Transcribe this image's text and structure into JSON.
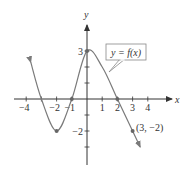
{
  "chart_data": {
    "type": "line",
    "title": "",
    "xlabel": "x",
    "ylabel": "y",
    "xlim": [
      -4.5,
      5
    ],
    "ylim": [
      -3,
      4
    ],
    "x_ticks": [
      -4,
      -3,
      -2,
      -1,
      1,
      2,
      3,
      4
    ],
    "x_tick_labels": [
      "−4",
      "−2",
      "−1",
      "1",
      "2",
      "3",
      "4"
    ],
    "x_tick_label_values": [
      -4,
      -2,
      -1,
      1,
      2,
      3,
      4
    ],
    "y_ticks": [
      -3,
      -2,
      -1,
      1,
      2,
      3
    ],
    "y_tick_labels": [
      "3",
      "−2"
    ],
    "y_tick_label_values": [
      3,
      -2
    ],
    "grid": false,
    "series": [
      {
        "name": "y = f(x)",
        "points": [
          [
            -3.7,
            2.3
          ],
          [
            -3,
            0
          ],
          [
            -2,
            -2
          ],
          [
            -1,
            0
          ],
          [
            0,
            3
          ],
          [
            1,
            2
          ],
          [
            2,
            0
          ],
          [
            3,
            -2
          ],
          [
            3.5,
            -3
          ]
        ],
        "arrow_ends": true
      }
    ],
    "marked_points": [
      [
        -2,
        -2
      ],
      [
        -1,
        0
      ],
      [
        0,
        3
      ],
      [
        2,
        0
      ],
      [
        3,
        -2
      ]
    ],
    "annotations": [
      {
        "text": "y = f(x)",
        "type": "callout-box",
        "points_to": [
          1.3,
          1.3
        ]
      },
      {
        "text": "(3, −2)",
        "at": [
          3,
          -2
        ]
      }
    ],
    "curve_color": "#7a7a7a",
    "axis_color": "#333333"
  }
}
